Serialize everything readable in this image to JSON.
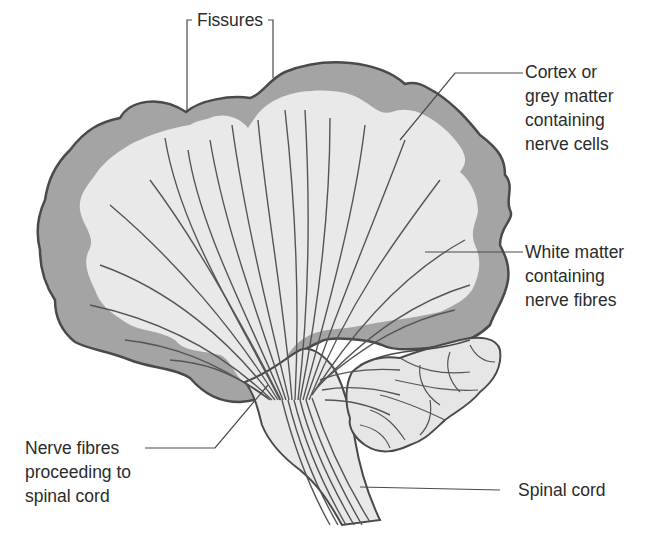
{
  "diagram": {
    "colors": {
      "background": "#ffffff",
      "cortex_grey": "#a4a4a4",
      "white_matter": "#e9e9e9",
      "outline": "#4a4a4a",
      "fibre_lines": "#555555",
      "text": "#2b2b2b"
    },
    "labels": {
      "fissures": {
        "text": "Fissures"
      },
      "cortex": {
        "lines": [
          "Cortex or",
          "grey matter",
          "containing",
          "nerve cells"
        ]
      },
      "white_matter": {
        "lines": [
          "White matter",
          "containing",
          "nerve fibres"
        ]
      },
      "nerve_fibres": {
        "lines": [
          "Nerve fibres",
          "proceeding to",
          "spinal cord"
        ]
      },
      "spinal_cord": {
        "text": "Spinal cord"
      }
    }
  }
}
